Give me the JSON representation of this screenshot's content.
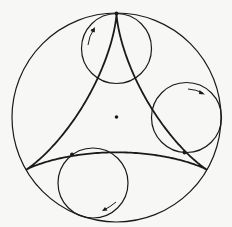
{
  "diagram": {
    "title": "",
    "colors": {
      "background": "#f7f7f5",
      "stroke": "#1a1a1a"
    },
    "fixed_circle": {
      "cx": 116.5,
      "cy": 117.5,
      "r": 104.5
    },
    "center_point": {
      "cx": 116.5,
      "cy": 117.5
    },
    "cusps": [
      {
        "name": "top",
        "x": 116.5,
        "y": 13
      },
      {
        "name": "bottom-left",
        "x": 26,
        "y": 169.7
      },
      {
        "name": "bottom-right",
        "x": 207,
        "y": 169.7
      }
    ],
    "rolling_circles": [
      {
        "name": "top",
        "cx": 116.5,
        "cy": 48,
        "r": 35,
        "tangent_point": {
          "x": 116.5,
          "y": 13
        },
        "arrow_direction": "counterclockwise-up"
      },
      {
        "name": "right",
        "cx": 186.5,
        "cy": 118,
        "r": 35,
        "tangent_point": {
          "x": 184,
          "y": 152
        },
        "arrow_direction": "clockwise"
      },
      {
        "name": "bottom",
        "cx": 92.5,
        "cy": 183,
        "r": 35,
        "tangent_point": {
          "x": 72,
          "y": 154
        },
        "arrow_direction": "clockwise-down"
      }
    ]
  }
}
